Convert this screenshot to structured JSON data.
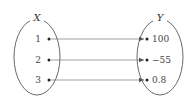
{
  "diagram": {
    "type": "function-mapping",
    "domain_set": {
      "label": "X",
      "elements": [
        "1",
        "2",
        "3"
      ]
    },
    "codomain_set": {
      "label": "Y",
      "elements": [
        "100",
        "−55",
        "0.8"
      ]
    },
    "mappings": [
      {
        "from": "1",
        "to": "100"
      },
      {
        "from": "2",
        "to": "−55"
      },
      {
        "from": "3",
        "to": "0.8"
      }
    ],
    "colors": {
      "stroke": "#333333",
      "arrow": "#666666",
      "text": "#444444"
    }
  }
}
